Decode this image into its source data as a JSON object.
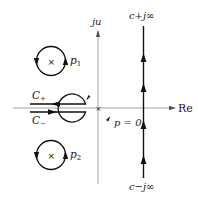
{
  "colors": {
    "axis": "#9a9a9a",
    "contour": "#111111",
    "text": "#222222",
    "background": "#ffffff"
  },
  "axes": {
    "real_label": "Re",
    "imag_label": "ju"
  },
  "vertical_contour": {
    "top_label": "c+j∞",
    "bottom_label": "c−j∞",
    "direction": "upward"
  },
  "branch_cut_contours": {
    "upper_label": "C₊",
    "upper_label_base": "C",
    "upper_label_sub": "+",
    "lower_label": "C₋",
    "lower_label_base": "C",
    "lower_label_sub": "−"
  },
  "origin_circle": {
    "label": "p = 0"
  },
  "poles": [
    {
      "label_base": "p",
      "label_sub": "1",
      "marker": "×"
    },
    {
      "label_base": "p",
      "label_sub": "2",
      "marker": "×"
    }
  ]
}
